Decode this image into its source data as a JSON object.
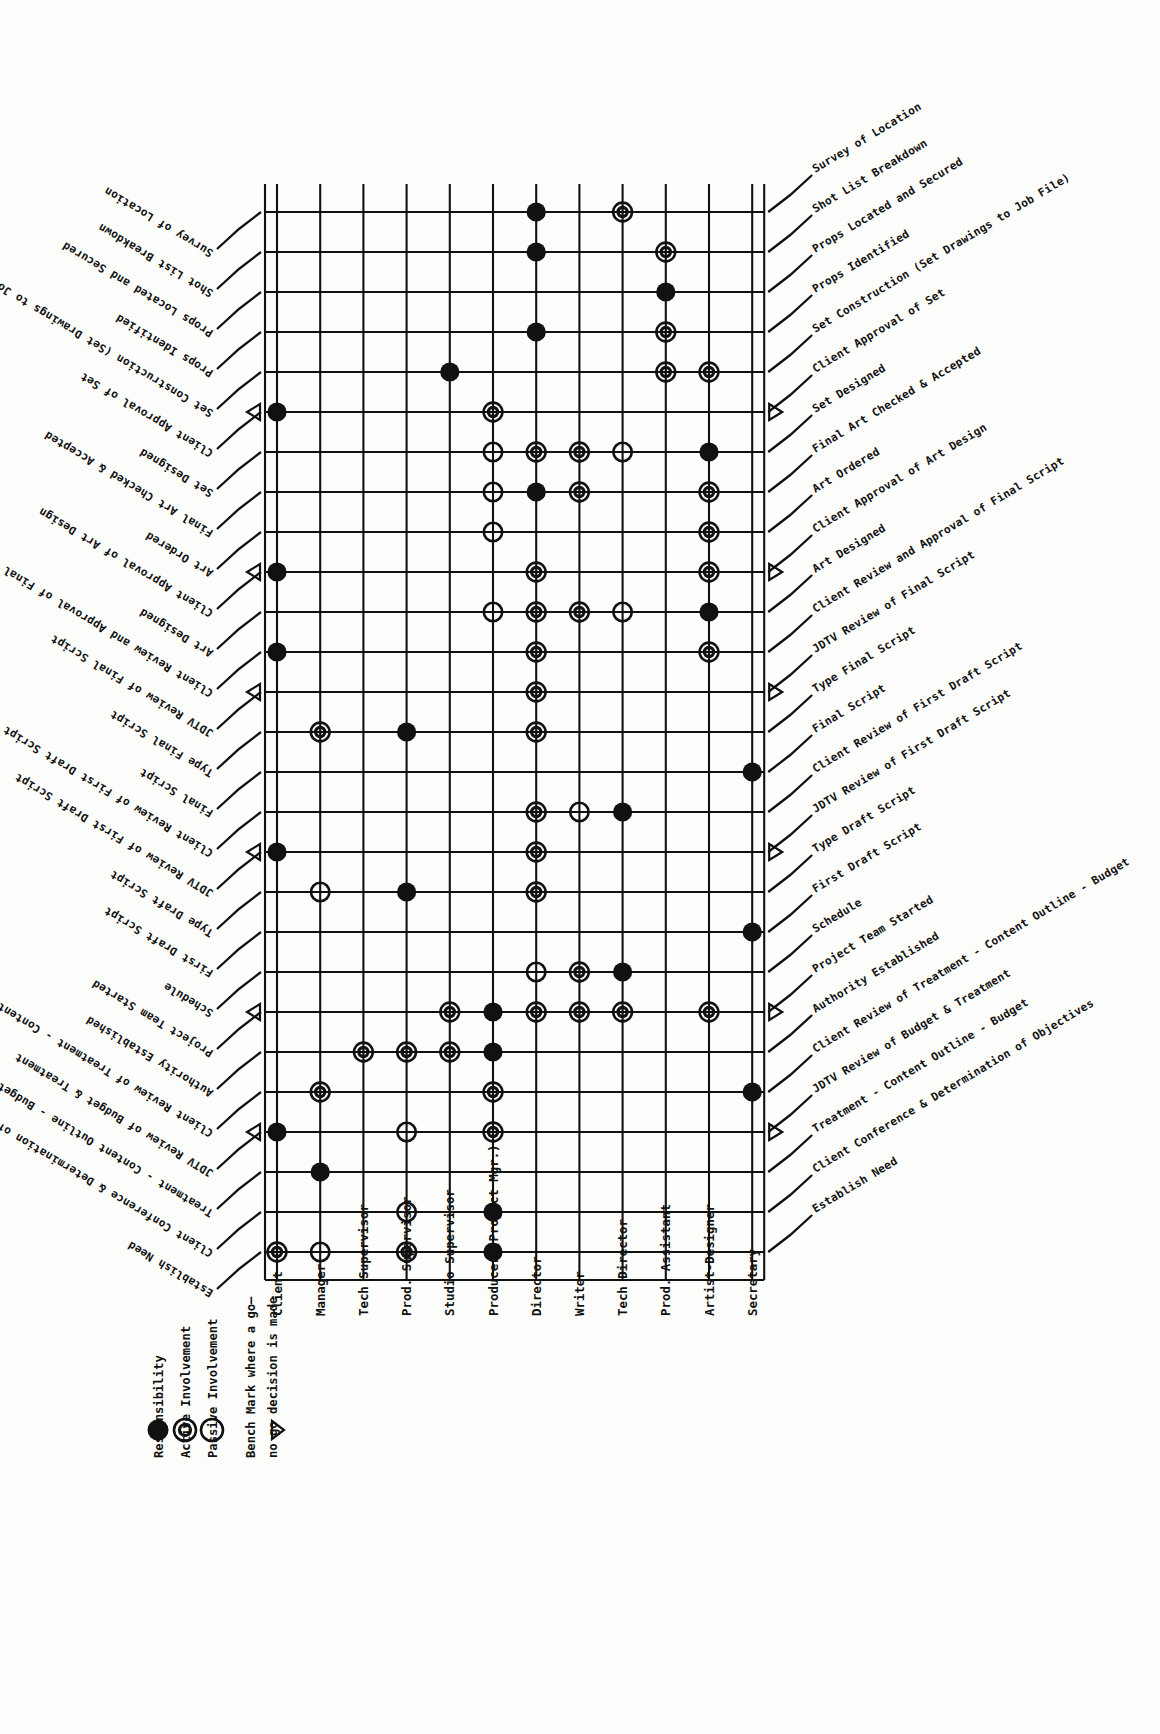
{
  "legend": {
    "items": [
      {
        "symbol": "filled-circle",
        "label": "Responsibility"
      },
      {
        "symbol": "double-circle",
        "label": "Active Involvement"
      },
      {
        "symbol": "open-circle",
        "label": "Passive Involvement"
      },
      {
        "symbol": "triangle",
        "label": "Bench Mark where a go—\nno go decision is made"
      }
    ],
    "lines": [
      "Responsibility",
      "Active Involvement",
      "Passive Involvement",
      "Bench Mark where a go—",
      "no go decision is made"
    ]
  },
  "roles": [
    "Client",
    "Manager",
    "Tech Supervisor",
    "Prod. Supervisor",
    "Studio Supervisor",
    "Producer (Project Mgr.)",
    "Director",
    "Writer",
    "Tech Director",
    "Prod. Assistant",
    "Artist-Designer",
    "Secretary"
  ],
  "tasks": [
    "Survey of Location",
    "Shot List Breakdown",
    "Props Located and Secured",
    "Props Identified",
    "Set Construction (Set Drawings to Job File)",
    "Client Approval of Set",
    "Set Designed",
    "Final Art Checked & Accepted",
    "Art Ordered",
    "Client Approval of Art Design",
    "Art Designed",
    "Client Review and Approval of Final Script",
    "JDTV Review of Final Script",
    "Type Final Script",
    "Final Script",
    "Client Review of First Draft Script",
    "JDTV Review of First Draft Script",
    "Type Draft Script",
    "First Draft Script",
    "Schedule",
    "Project Team Started",
    "Authority Established",
    "Client Review of Treatment - Content Outline - Budget",
    "JDTV Review of Budget & Treatment",
    "Treatment - Content Outline - Budget",
    "Client Conference & Determination of Objectives",
    "Establish Need"
  ],
  "benchmark_tasks": [
    "Client Approval of Set",
    "Client Approval of Art Design",
    "JDTV Review of Final Script",
    "JDTV Review of First Draft Script",
    "Project Team Started",
    "JDTV Review of Budget & Treatment"
  ],
  "chart_data": {
    "type": "table",
    "xlabel": "Roles",
    "ylabel": "Tasks",
    "legend_position": "bottom-left",
    "grid": true,
    "marker_types": {
      "F": "Responsibility (filled circle)",
      "D": "Active Involvement (double circle)",
      "O": "Passive Involvement (open circle)",
      "T": "Bench Mark where a go-no go decision is made (triangle)"
    },
    "columns": [
      "Client",
      "Manager",
      "Tech Supervisor",
      "Prod. Supervisor",
      "Studio Supervisor",
      "Producer (Project Mgr.)",
      "Director",
      "Writer",
      "Tech Director",
      "Prod. Assistant",
      "Artist-Designer",
      "Secretary"
    ],
    "rows": [
      {
        "task": "Survey of Location",
        "benchmark": false,
        "cells": {
          "Director": "F",
          "Tech Director": "D"
        }
      },
      {
        "task": "Shot List Breakdown",
        "benchmark": false,
        "cells": {
          "Director": "F",
          "Prod. Assistant": "D"
        }
      },
      {
        "task": "Props Located and Secured",
        "benchmark": false,
        "cells": {
          "Prod. Assistant": "F"
        }
      },
      {
        "task": "Props Identified",
        "benchmark": false,
        "cells": {
          "Director": "F",
          "Prod. Assistant": "D"
        }
      },
      {
        "task": "Set Construction (Set Drawings to Job File)",
        "benchmark": false,
        "cells": {
          "Studio Supervisor": "F",
          "Prod. Assistant": "D",
          "Artist-Designer": "D"
        }
      },
      {
        "task": "Client Approval of Set",
        "benchmark": true,
        "cells": {
          "Client": "F",
          "Producer (Project Mgr.)": "D"
        }
      },
      {
        "task": "Set Designed",
        "benchmark": false,
        "cells": {
          "Producer (Project Mgr.)": "O",
          "Director": "D",
          "Writer": "D",
          "Tech Director": "O",
          "Artist-Designer": "F"
        }
      },
      {
        "task": "Final Art Checked & Accepted",
        "benchmark": false,
        "cells": {
          "Producer (Project Mgr.)": "O",
          "Director": "F",
          "Writer": "D",
          "Artist-Designer": "D"
        }
      },
      {
        "task": "Art Ordered",
        "benchmark": false,
        "cells": {
          "Producer (Project Mgr.)": "O",
          "Artist-Designer": "D"
        }
      },
      {
        "task": "Client Approval of Art Design",
        "benchmark": true,
        "cells": {
          "Client": "F",
          "Director": "D",
          "Artist-Designer": "D"
        }
      },
      {
        "task": "Art Designed",
        "benchmark": false,
        "cells": {
          "Producer (Project Mgr.)": "O",
          "Director": "D",
          "Writer": "D",
          "Tech Director": "O",
          "Artist-Designer": "F"
        }
      },
      {
        "task": "Client Review and Approval of Final Script",
        "benchmark": false,
        "cells": {
          "Client": "F",
          "Director": "D",
          "Artist-Designer": "D"
        }
      },
      {
        "task": "JDTV Review of Final Script",
        "benchmark": true,
        "cells": {
          "Director": "D"
        }
      },
      {
        "task": "Type Final Script",
        "benchmark": false,
        "cells": {
          "Manager": "D",
          "Prod. Supervisor": "F",
          "Director": "D"
        }
      },
      {
        "task": "Final Script",
        "benchmark": false,
        "cells": {
          "Secretary": "F"
        }
      },
      {
        "task": "Client Review of First Draft Script",
        "benchmark": false,
        "cells": {
          "Director": "D",
          "Writer": "O",
          "Tech Director": "F"
        }
      },
      {
        "task": "JDTV Review of First Draft Script",
        "benchmark": true,
        "cells": {
          "Client": "F",
          "Director": "D"
        }
      },
      {
        "task": "Type Draft Script",
        "benchmark": false,
        "cells": {
          "Manager": "O",
          "Prod. Supervisor": "F",
          "Director": "D"
        }
      },
      {
        "task": "First Draft Script",
        "benchmark": false,
        "cells": {
          "Secretary": "F"
        }
      },
      {
        "task": "Schedule",
        "benchmark": false,
        "cells": {
          "Director": "O",
          "Writer": "D",
          "Tech Director": "F"
        }
      },
      {
        "task": "Project Team Started",
        "benchmark": true,
        "cells": {
          "Studio Supervisor": "D",
          "Producer (Project Mgr.)": "F",
          "Director": "D",
          "Writer": "D",
          "Tech Director": "D",
          "Artist-Designer": "D"
        }
      },
      {
        "task": "Authority Established",
        "benchmark": false,
        "cells": {
          "Tech Supervisor": "D",
          "Prod. Supervisor": "D",
          "Studio Supervisor": "D",
          "Producer (Project Mgr.)": "F"
        }
      },
      {
        "task": "Client Review of Treatment - Content Outline - Budget",
        "benchmark": false,
        "cells": {
          "Manager": "D",
          "Producer (Project Mgr.)": "D",
          "Secretary": "F"
        }
      },
      {
        "task": "JDTV Review of Budget & Treatment",
        "benchmark": true,
        "cells": {
          "Client": "F",
          "Prod. Supervisor": "O",
          "Producer (Project Mgr.)": "D"
        }
      },
      {
        "task": "Treatment - Content Outline - Budget",
        "benchmark": false,
        "cells": {
          "Manager": "F"
        }
      },
      {
        "task": "Client Conference & Determination of Objectives",
        "benchmark": false,
        "cells": {
          "Prod. Supervisor": "O",
          "Producer (Project Mgr.)": "F"
        }
      },
      {
        "task": "Establish Need",
        "benchmark": false,
        "cells": {
          "Client": "D",
          "Manager": "O",
          "Prod. Supervisor": "D",
          "Producer (Project Mgr.)": "F"
        }
      }
    ]
  }
}
